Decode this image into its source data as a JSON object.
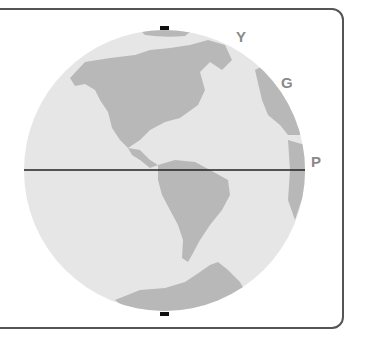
{
  "figure": {
    "labels": [
      {
        "id": "Y",
        "text": "Y"
      },
      {
        "id": "G",
        "text": "G"
      },
      {
        "id": "P",
        "text": "P"
      }
    ],
    "colors": {
      "ocean": "#e6e6e6",
      "land": "#b8b8b8",
      "line": "#222222",
      "border": "#555555",
      "label": "#8a8a8a"
    }
  }
}
